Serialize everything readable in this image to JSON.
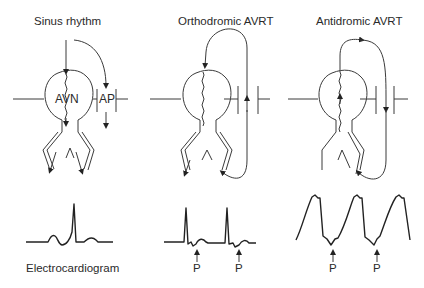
{
  "panels": [
    {
      "title": "Sinus rhythm",
      "node_label": "AVN",
      "pathway_label": "AP"
    },
    {
      "title": "Orthodromic AVRT"
    },
    {
      "title": "Antidromic AVRT"
    }
  ],
  "ecg": {
    "caption": "Electrocardiogram",
    "p_labels": [
      "P",
      "P",
      "P",
      "P"
    ]
  }
}
